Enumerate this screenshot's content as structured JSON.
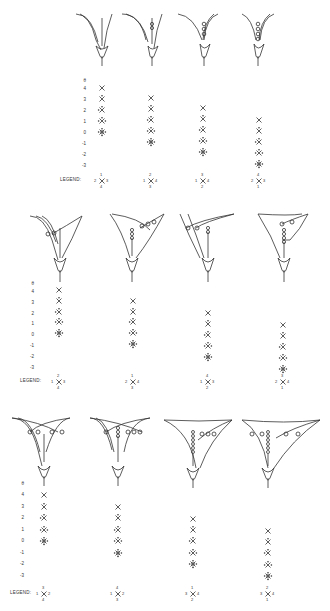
{
  "figure": {
    "rows": [
      {
        "id": "row1",
        "flowers_y": 0,
        "axis": {
          "label": "θ",
          "ticks": [
            "4",
            "3",
            "2",
            "1",
            "0",
            "-1",
            "-2",
            "-3"
          ],
          "x": 92,
          "top": 85
        },
        "legend_word": "LEGEND:",
        "panels": [
          {
            "x": 100,
            "symbols_top_index": 0,
            "count": 5,
            "legend": {
              "top": "1",
              "left": "2",
              "right": "3",
              "bottom": "4"
            }
          },
          {
            "x": 152,
            "symbols_top_index": 1,
            "count": 5,
            "legend": {
              "top": "2",
              "left": "1",
              "right": "4",
              "bottom": "3"
            }
          },
          {
            "x": 205,
            "symbols_top_index": 2,
            "count": 5,
            "legend": {
              "top": "3",
              "left": "1",
              "right": "4",
              "bottom": "2"
            }
          },
          {
            "x": 258,
            "symbols_top_index": 3,
            "count": 5,
            "legend": {
              "top": "4",
              "left": "2",
              "right": "3",
              "bottom": "1"
            }
          }
        ]
      },
      {
        "id": "row2",
        "axis": {
          "label": "θ",
          "ticks": [
            "4",
            "3",
            "2",
            "1",
            "0",
            "-1",
            "-2",
            "-3"
          ],
          "x": 34,
          "top": 283
        },
        "legend_word": "LEGEND:",
        "panels": [
          {
            "x": 58,
            "symbols_top_index": 0,
            "count": 5,
            "legend": {
              "top": "2",
              "left": "1",
              "right": "3",
              "bottom": "4"
            }
          },
          {
            "x": 132,
            "symbols_top_index": 1,
            "count": 5,
            "legend": {
              "top": "1",
              "left": "2",
              "right": "4",
              "bottom": "3"
            }
          },
          {
            "x": 208,
            "symbols_top_index": 2,
            "count": 5,
            "legend": {
              "top": "4",
              "left": "1",
              "right": "3",
              "bottom": "2"
            }
          },
          {
            "x": 282,
            "symbols_top_index": 3,
            "count": 5,
            "legend": {
              "top": "3",
              "left": "2",
              "right": "4",
              "bottom": "1"
            }
          }
        ]
      },
      {
        "id": "row3",
        "axis": {
          "label": "θ",
          "ticks": [
            "4",
            "3",
            "2",
            "1",
            "0",
            "-1",
            "-2",
            "-3"
          ],
          "x": 22,
          "top": 488
        },
        "legend_word": "LEGEND:",
        "panels": [
          {
            "x": 44,
            "symbols_top_index": 0,
            "count": 5,
            "legend": {
              "top": "3",
              "left": "1",
              "right": "2",
              "bottom": "4"
            }
          },
          {
            "x": 118,
            "symbols_top_index": 1,
            "count": 5,
            "legend": {
              "top": "4",
              "left": "1",
              "right": "2",
              "bottom": "3"
            }
          },
          {
            "x": 193,
            "symbols_top_index": 2,
            "count": 5,
            "legend": {
              "top": "1",
              "left": "3",
              "right": "4",
              "bottom": "2"
            }
          },
          {
            "x": 268,
            "symbols_top_index": 3,
            "count": 5,
            "legend": {
              "top": "2",
              "left": "3",
              "right": "4",
              "bottom": "1"
            }
          }
        ]
      }
    ],
    "legend_label": "LEGEND:",
    "theta_label": "θ",
    "ticks": [
      "4",
      "3",
      "2",
      "1",
      "0",
      "-1",
      "-2",
      "-3"
    ],
    "l": {
      "r1": [
        [
          "2",
          "1",
          "3",
          "4"
        ],
        [
          "1",
          "2",
          "4",
          "3"
        ],
        [
          "1",
          "3",
          "4",
          "2"
        ],
        [
          "2",
          "4",
          "3",
          "1"
        ]
      ],
      "r2": [
        [
          "1",
          "2",
          "3",
          "4"
        ],
        [
          "2",
          "1",
          "4",
          "3"
        ],
        [
          "1",
          "4",
          "3",
          "2"
        ],
        [
          "2",
          "3",
          "4",
          "1"
        ]
      ],
      "r3": [
        [
          "1",
          "3",
          "2",
          "4"
        ],
        [
          "1",
          "4",
          "2",
          "3"
        ],
        [
          "3",
          "1",
          "4",
          "2"
        ],
        [
          "3",
          "2",
          "4",
          "1"
        ]
      ]
    }
  }
}
